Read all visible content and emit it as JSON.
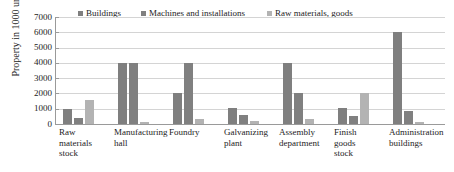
{
  "chart_data": {
    "type": "bar",
    "title": "",
    "xlabel": "",
    "ylabel": "Property in 1000 units",
    "ylim": [
      0,
      7000
    ],
    "ytick_step": 1000,
    "yticks": [
      "7000",
      "6000",
      "5000",
      "4000",
      "3000",
      "2000",
      "1000",
      "0"
    ],
    "grid": true,
    "legend_position": "top",
    "categories": [
      "Raw materials stock",
      "Manufacturing hall",
      "Foundry",
      "Galvanizing plant",
      "Assembly department",
      "Finish goods stock",
      "Administration buildings"
    ],
    "category_lines": [
      [
        "Raw",
        "materials",
        "stock"
      ],
      [
        "Manufacturing",
        "hall"
      ],
      [
        "Foundry"
      ],
      [
        "Galvanizing",
        "plant"
      ],
      [
        "Assembly",
        "department"
      ],
      [
        "Finish",
        "goods",
        "stock"
      ],
      [
        "Administration",
        "buildings"
      ]
    ],
    "series": [
      {
        "name": "Buildings",
        "color": "#7f7f7f",
        "values": [
          1000,
          4000,
          2000,
          1050,
          4000,
          1050,
          6050
        ]
      },
      {
        "name": "Machines and installations",
        "color": "#808080",
        "values": [
          400,
          4000,
          4000,
          560,
          2050,
          520,
          820
        ]
      },
      {
        "name": "Raw materials, goods",
        "color": "#b3b3b3",
        "values": [
          1600,
          150,
          320,
          200,
          360,
          2040,
          110
        ]
      }
    ]
  },
  "colors": {
    "grid": "#d4d4d4",
    "axis": "#9a9a9a",
    "text": "#1c1c1c",
    "background": "#ffffff"
  }
}
